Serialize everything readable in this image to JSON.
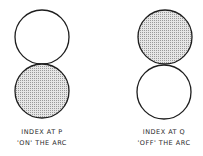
{
  "diagram": {
    "colors": {
      "stroke": "#1e1e1e",
      "fill_shaded": "#d4d4d4",
      "fill_clear": "#ffffff"
    },
    "panels": [
      {
        "id": "p",
        "caption_line1": "INDEX AT P",
        "caption_line2": "'ON' THE ARC",
        "circles": [
          {
            "position": "top",
            "shaded": false
          },
          {
            "position": "bottom",
            "shaded": true
          }
        ]
      },
      {
        "id": "q",
        "caption_line1": "INDEX AT Q",
        "caption_line2": "'OFF' THE ARC",
        "circles": [
          {
            "position": "top",
            "shaded": true
          },
          {
            "position": "bottom",
            "shaded": false
          }
        ]
      }
    ]
  }
}
